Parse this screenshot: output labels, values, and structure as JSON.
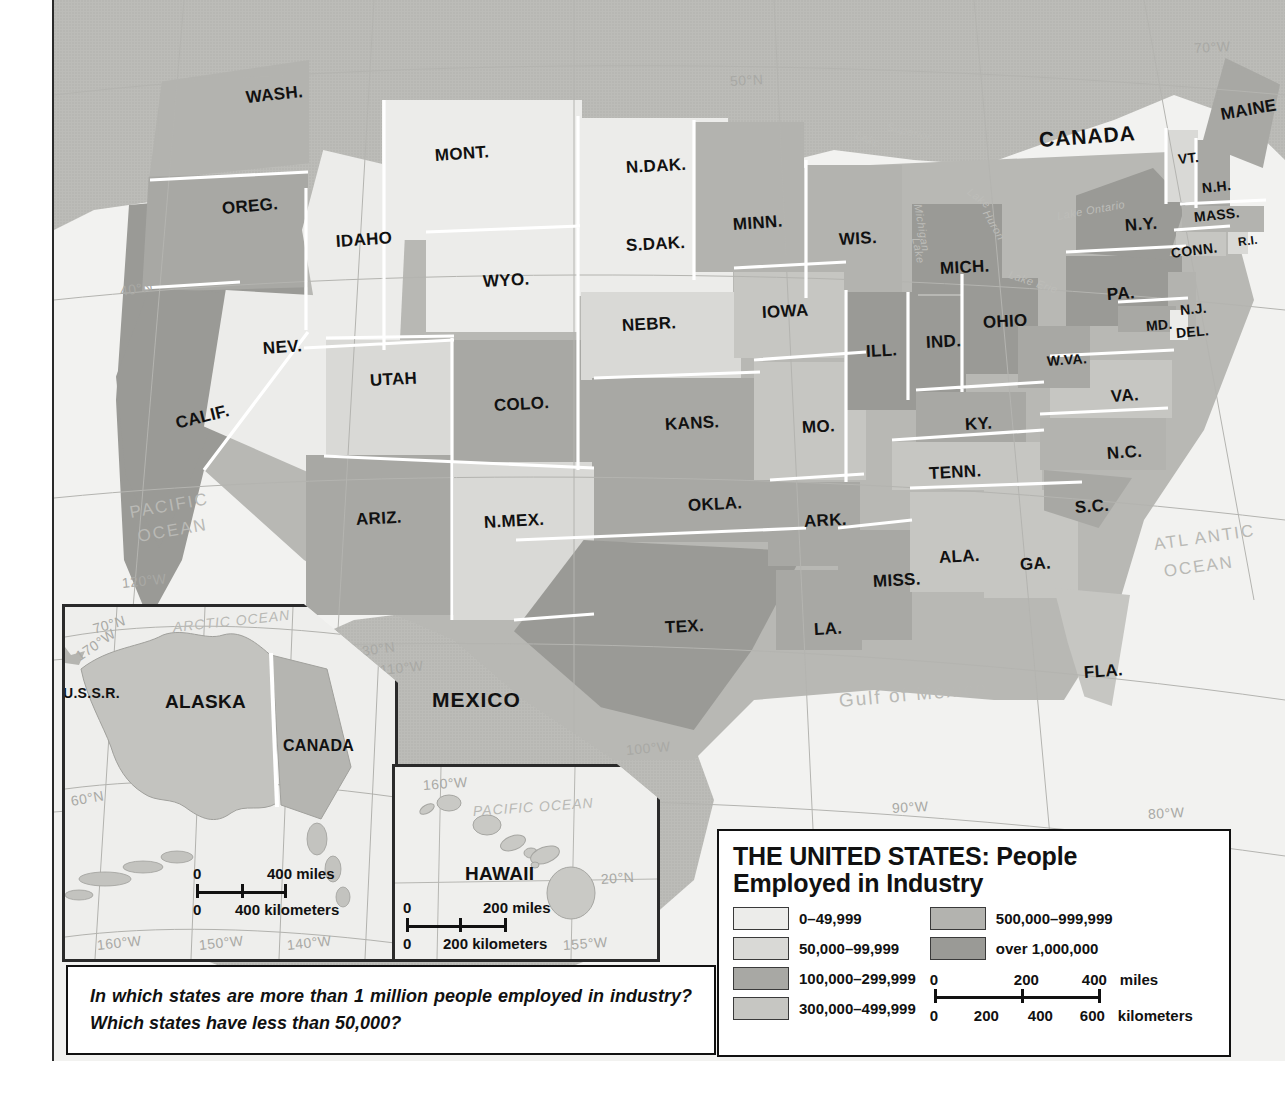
{
  "legend": {
    "title_line1": "THE UNITED STATES: People",
    "title_line2": "Employed in Industry",
    "classes": [
      {
        "label": "0–49,999",
        "color": "#ececea"
      },
      {
        "label": "50,000–99,999",
        "color": "#d9d9d6"
      },
      {
        "label": "100,000–299,999",
        "color": "#a8a8a4"
      },
      {
        "label": "300,000–499,999",
        "color": "#c6c6c2"
      },
      {
        "label": "500,000–999,999",
        "color": "#b3b3af"
      },
      {
        "label": "over 1,000,000",
        "color": "#9a9a96"
      }
    ],
    "scale": {
      "miles_ticks": [
        "0",
        "200",
        "400"
      ],
      "miles_unit": "miles",
      "km_ticks": [
        "0",
        "200",
        "400",
        "600"
      ],
      "km_unit": "kilometers"
    }
  },
  "question": {
    "text": "In which states are more than 1 million people employed in industry? Which states have less than 50,000?"
  },
  "countries": [
    {
      "name": "CANADA",
      "x": 985,
      "y": 128,
      "rot": -4
    },
    {
      "name": "MEXICO",
      "x": 378,
      "y": 688,
      "rot": 0
    }
  ],
  "oceans": [
    {
      "name": "PACIFIC",
      "x": 76,
      "y": 503,
      "rot": -10,
      "size": 17
    },
    {
      "name": "OCEAN",
      "x": 84,
      "y": 527,
      "rot": -10,
      "size": 17
    },
    {
      "name": "ATL ANTIC",
      "x": 1100,
      "y": 535,
      "rot": -8,
      "size": 17
    },
    {
      "name": "OCEAN",
      "x": 1110,
      "y": 562,
      "rot": -8,
      "size": 17
    },
    {
      "name": "Gulf of Mexico",
      "x": 785,
      "y": 690,
      "rot": -5,
      "size": 19
    }
  ],
  "lakes": [
    {
      "name": "Lake",
      "x": 802,
      "y": 128,
      "rot": 22
    },
    {
      "name": "Superior",
      "x": 833,
      "y": 120,
      "rot": 14
    },
    {
      "name": "Lake",
      "x": 862,
      "y": 232,
      "rot": 78
    },
    {
      "name": "Michigan",
      "x": 864,
      "y": 198,
      "rot": 80
    },
    {
      "name": "Lake",
      "x": 915,
      "y": 184,
      "rot": 38
    },
    {
      "name": "Huron",
      "x": 932,
      "y": 205,
      "rot": 60
    },
    {
      "name": "Lake Erie",
      "x": 955,
      "y": 268,
      "rot": 18
    },
    {
      "name": "Lake Ontario",
      "x": 1003,
      "y": 210,
      "rot": -10
    }
  ],
  "graticule_labels": [
    {
      "name": "50°N",
      "x": 676,
      "y": 73,
      "rot": -3
    },
    {
      "name": "40°N",
      "x": 66,
      "y": 283,
      "rot": -8
    },
    {
      "name": "30°N",
      "x": 308,
      "y": 643,
      "rot": -8
    },
    {
      "name": "120°W",
      "x": 68,
      "y": 575,
      "rot": -6
    },
    {
      "name": "110°W",
      "x": 326,
      "y": 662,
      "rot": -6
    },
    {
      "name": "100°W",
      "x": 572,
      "y": 742,
      "rot": -5
    },
    {
      "name": "90°W",
      "x": 838,
      "y": 800,
      "rot": -3
    },
    {
      "name": "80°W",
      "x": 1094,
      "y": 806,
      "rot": -3
    },
    {
      "name": "70°W",
      "x": 1140,
      "y": 40,
      "rot": -3
    }
  ],
  "states": [
    {
      "abbr": "WASH.",
      "x": 192,
      "y": 88,
      "rot": -6,
      "class": 4,
      "size": "md"
    },
    {
      "abbr": "OREG.",
      "x": 168,
      "y": 199,
      "rot": -5,
      "class": 2,
      "size": "md"
    },
    {
      "abbr": "IDAHO",
      "x": 282,
      "y": 232,
      "rot": -4,
      "class": 0,
      "size": "md"
    },
    {
      "abbr": "MONT.",
      "x": 381,
      "y": 146,
      "rot": -4,
      "class": 0,
      "size": "md"
    },
    {
      "abbr": "N.DAK.",
      "x": 572,
      "y": 158,
      "rot": -3,
      "class": 0,
      "size": "md"
    },
    {
      "abbr": "S.DAK.",
      "x": 572,
      "y": 236,
      "rot": -3,
      "class": 0,
      "size": "md"
    },
    {
      "abbr": "MINN.",
      "x": 679,
      "y": 215,
      "rot": -4,
      "class": 4,
      "size": "md"
    },
    {
      "abbr": "WIS.",
      "x": 785,
      "y": 230,
      "rot": -3,
      "class": 4,
      "size": "md"
    },
    {
      "abbr": "MICH.",
      "x": 886,
      "y": 259,
      "rot": -3,
      "class": 5,
      "size": "md"
    },
    {
      "abbr": "WYO.",
      "x": 429,
      "y": 272,
      "rot": -3,
      "class": 0,
      "size": "md"
    },
    {
      "abbr": "NEV.",
      "x": 209,
      "y": 339,
      "rot": -4,
      "class": 0,
      "size": "md"
    },
    {
      "abbr": "UTAH",
      "x": 316,
      "y": 371,
      "rot": -3,
      "class": 1,
      "size": "md"
    },
    {
      "abbr": "COLO.",
      "x": 440,
      "y": 396,
      "rot": -3,
      "class": 2,
      "size": "md"
    },
    {
      "abbr": "NEBR.",
      "x": 568,
      "y": 316,
      "rot": -3,
      "class": 1,
      "size": "md"
    },
    {
      "abbr": "IOWA",
      "x": 708,
      "y": 303,
      "rot": -3,
      "class": 3,
      "size": "md"
    },
    {
      "abbr": "ILL.",
      "x": 812,
      "y": 342,
      "rot": -3,
      "class": 5,
      "size": "md"
    },
    {
      "abbr": "IND.",
      "x": 872,
      "y": 333,
      "rot": -3,
      "class": 5,
      "size": "md"
    },
    {
      "abbr": "OHIO",
      "x": 929,
      "y": 313,
      "rot": -3,
      "class": 5,
      "size": "md"
    },
    {
      "abbr": "PA.",
      "x": 1053,
      "y": 285,
      "rot": -4,
      "class": 5,
      "size": "md"
    },
    {
      "abbr": "N.Y.",
      "x": 1071,
      "y": 216,
      "rot": -4,
      "class": 5,
      "size": "md"
    },
    {
      "abbr": "VT.",
      "x": 1124,
      "y": 151,
      "rot": -6,
      "class": 1,
      "size": "sm"
    },
    {
      "abbr": "N.H.",
      "x": 1148,
      "y": 180,
      "rot": -6,
      "class": 2,
      "size": "sm"
    },
    {
      "abbr": "MAINE",
      "x": 1167,
      "y": 105,
      "rot": -10,
      "class": 2,
      "size": "md"
    },
    {
      "abbr": "MASS.",
      "x": 1140,
      "y": 209,
      "rot": -6,
      "class": 4,
      "size": "sm"
    },
    {
      "abbr": "CONN.",
      "x": 1117,
      "y": 245,
      "rot": -7,
      "class": 3,
      "size": "sm"
    },
    {
      "abbr": "R.I.",
      "x": 1184,
      "y": 235,
      "rot": -7,
      "class": 1,
      "size": "xs"
    },
    {
      "abbr": "N.J.",
      "x": 1126,
      "y": 302,
      "rot": -5,
      "class": 4,
      "size": "sm"
    },
    {
      "abbr": "MD.",
      "x": 1092,
      "y": 318,
      "rot": -5,
      "class": 2,
      "size": "sm"
    },
    {
      "abbr": "DEL.",
      "x": 1122,
      "y": 325,
      "rot": -5,
      "class": 0,
      "size": "sm"
    },
    {
      "abbr": "W.VA.",
      "x": 993,
      "y": 353,
      "rot": -4,
      "class": 2,
      "size": "sm"
    },
    {
      "abbr": "VA.",
      "x": 1057,
      "y": 387,
      "rot": -4,
      "class": 3,
      "size": "md"
    },
    {
      "abbr": "KY.",
      "x": 911,
      "y": 415,
      "rot": -3,
      "class": 2,
      "size": "md"
    },
    {
      "abbr": "MO.",
      "x": 748,
      "y": 418,
      "rot": -3,
      "class": 3,
      "size": "md"
    },
    {
      "abbr": "KANS.",
      "x": 611,
      "y": 415,
      "rot": -3,
      "class": 2,
      "size": "md"
    },
    {
      "abbr": "N.C.",
      "x": 1053,
      "y": 444,
      "rot": -4,
      "class": 4,
      "size": "md"
    },
    {
      "abbr": "TENN.",
      "x": 875,
      "y": 464,
      "rot": -3,
      "class": 3,
      "size": "md"
    },
    {
      "abbr": "S.C.",
      "x": 1021,
      "y": 498,
      "rot": -4,
      "class": 2,
      "size": "md"
    },
    {
      "abbr": "ARIZ.",
      "x": 302,
      "y": 510,
      "rot": -3,
      "class": 2,
      "size": "md"
    },
    {
      "abbr": "N.MEX.",
      "x": 430,
      "y": 513,
      "rot": -3,
      "class": 1,
      "size": "md"
    },
    {
      "abbr": "OKLA.",
      "x": 634,
      "y": 496,
      "rot": -3,
      "class": 2,
      "size": "md"
    },
    {
      "abbr": "ARK.",
      "x": 750,
      "y": 512,
      "rot": -3,
      "class": 2,
      "size": "md"
    },
    {
      "abbr": "ALA.",
      "x": 885,
      "y": 548,
      "rot": -3,
      "class": 3,
      "size": "md"
    },
    {
      "abbr": "GA.",
      "x": 966,
      "y": 555,
      "rot": -3,
      "class": 3,
      "size": "md"
    },
    {
      "abbr": "MISS.",
      "x": 819,
      "y": 572,
      "rot": -3,
      "class": 2,
      "size": "md"
    },
    {
      "abbr": "LA.",
      "x": 760,
      "y": 620,
      "rot": -3,
      "class": 2,
      "size": "md"
    },
    {
      "abbr": "TEX.",
      "x": 611,
      "y": 618,
      "rot": -3,
      "class": 5,
      "size": "md"
    },
    {
      "abbr": "CALIF.",
      "x": 122,
      "y": 414,
      "rot": -14,
      "class": 5,
      "size": "md"
    },
    {
      "abbr": "FLA.",
      "x": 1030,
      "y": 663,
      "rot": -4,
      "class": 3,
      "size": "md"
    }
  ],
  "alaska_inset": {
    "title": "ALASKA",
    "neighbors": [
      "U.S.S.R.",
      "CANADA"
    ],
    "ocean": "ARCTIC OCEAN",
    "grid": [
      "70°N",
      "170°W",
      "60°N",
      "160°W",
      "150°W",
      "140°W"
    ],
    "scale": {
      "miles": "400 miles",
      "km": "400 kilometers",
      "zero": "0"
    }
  },
  "hawaii_inset": {
    "title": "HAWAII",
    "ocean": "PACIFIC OCEAN",
    "grid": [
      "160°W",
      "20°N",
      "155°W"
    ],
    "scale": {
      "miles": "200 miles",
      "km": "200 kilometers",
      "zero": "0"
    }
  }
}
